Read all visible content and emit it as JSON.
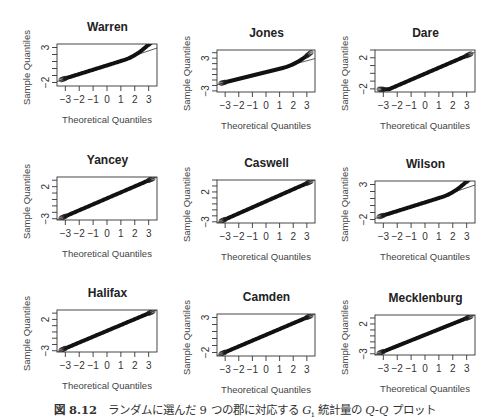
{
  "caption": {
    "figure_label": "図 8.12",
    "text_before": "ランダムに選んだ 9 つの郡に対応する ",
    "stat_symbol": "G",
    "stat_sub": "i",
    "text_middle": " 統計量の ",
    "qq": "Q-Q",
    "text_after": " プロット"
  },
  "chart_data": [
    {
      "type": "scatter",
      "title": "Warren",
      "xlabel": "Theoretical Quantiles",
      "ylabel": "Sample Quantiles",
      "xticks": [
        -3,
        -2,
        -1,
        0,
        1,
        2,
        3
      ],
      "yticks_labeled": [
        -2,
        3
      ],
      "xlim": [
        -3.6,
        3.6
      ],
      "ylim": [
        -2.5,
        3.5
      ],
      "shape": "convex_upper_tail",
      "grid": false
    },
    {
      "type": "scatter",
      "title": "Jones",
      "xlabel": "Theoretical Quantiles",
      "ylabel": "Sample Quantiles",
      "xticks": [
        -3,
        -2,
        -1,
        0,
        1,
        2,
        3
      ],
      "yticks_labeled": [
        -3,
        3
      ],
      "xlim": [
        -3.6,
        3.6
      ],
      "ylim": [
        -3.2,
        4.5
      ],
      "shape": "convex_upper_tail",
      "grid": false
    },
    {
      "type": "scatter",
      "title": "Dare",
      "xlabel": "Theoretical Quantiles",
      "ylabel": "Sample Quantiles",
      "xticks": [
        -3,
        -2,
        -1,
        0,
        1,
        2,
        3
      ],
      "yticks_labeled": [
        -2,
        2
      ],
      "xlim": [
        -3.6,
        3.6
      ],
      "ylim": [
        -2.4,
        3.0
      ],
      "shape": "flat_lower_tail",
      "grid": false
    },
    {
      "type": "scatter",
      "title": "Yancey",
      "xlabel": "Theoretical Quantiles",
      "ylabel": "Sample Quantiles",
      "xticks": [
        -3,
        -2,
        -1,
        0,
        1,
        2,
        3
      ],
      "yticks_labeled": [
        -3,
        2
      ],
      "xlim": [
        -3.6,
        3.6
      ],
      "ylim": [
        -3.2,
        3.5
      ],
      "shape": "near_linear",
      "grid": false
    },
    {
      "type": "scatter",
      "title": "Caswell",
      "xlabel": "Theoretical Quantiles",
      "ylabel": "Sample Quantiles",
      "xticks": [
        -3,
        -2,
        -1,
        0,
        1,
        2,
        3
      ],
      "yticks_labeled": [
        -3,
        2
      ],
      "xlim": [
        -3.6,
        3.6
      ],
      "ylim": [
        -3.2,
        4.0
      ],
      "shape": "near_linear",
      "grid": false
    },
    {
      "type": "scatter",
      "title": "Wilson",
      "xlabel": "Theoretical Quantiles",
      "ylabel": "Sample Quantiles",
      "xticks": [
        -3,
        -2,
        -1,
        0,
        1,
        2,
        3
      ],
      "yticks_labeled": [
        -2,
        3
      ],
      "xlim": [
        -3.6,
        3.6
      ],
      "ylim": [
        -2.5,
        3.5
      ],
      "shape": "convex_upper_tail",
      "grid": false
    },
    {
      "type": "scatter",
      "title": "Halifax",
      "xlabel": "Theoretical Quantiles",
      "ylabel": "Sample Quantiles",
      "xticks": [
        -3,
        -2,
        -1,
        0,
        1,
        2,
        3
      ],
      "yticks_labeled": [
        -3,
        2
      ],
      "xlim": [
        -3.6,
        3.6
      ],
      "ylim": [
        -3.2,
        3.5
      ],
      "shape": "near_linear",
      "grid": false
    },
    {
      "type": "scatter",
      "title": "Camden",
      "xlabel": "Theoretical Quantiles",
      "ylabel": "Sample Quantiles",
      "xticks": [
        -3,
        -2,
        -1,
        0,
        1,
        2,
        3
      ],
      "yticks_labeled": [
        -2,
        3
      ],
      "xlim": [
        -3.6,
        3.6
      ],
      "ylim": [
        -2.5,
        3.5
      ],
      "shape": "near_linear",
      "grid": false
    },
    {
      "type": "scatter",
      "title": "Mecklenburg",
      "xlabel": "Theoretical Quantiles",
      "ylabel": "Sample Quantiles",
      "xticks": [
        -3,
        -2,
        -1,
        0,
        1,
        2,
        3
      ],
      "yticks_labeled": [
        -3,
        2
      ],
      "xlim": [
        -3.6,
        3.6
      ],
      "ylim": [
        -3.2,
        3.5
      ],
      "shape": "near_linear",
      "grid": false
    }
  ]
}
